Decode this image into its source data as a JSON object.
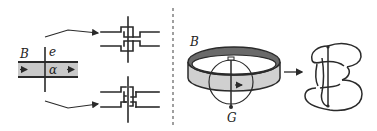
{
  "figure": {
    "left_panel": {
      "band_label": "B",
      "edge_label": "e",
      "arc_label": "α",
      "band_fill": "#c9c9c9",
      "crossings": [
        {
          "name": "upper-crossing"
        },
        {
          "name": "lower-crossing"
        }
      ]
    },
    "divider": {
      "style": "dashed",
      "color": "#777777"
    },
    "right_panel": {
      "band_label": "B",
      "graph_label": "G",
      "band_top_fill": "#6a6a6a",
      "band_side_fill": "#d0d0d0",
      "arrow": "→"
    }
  }
}
